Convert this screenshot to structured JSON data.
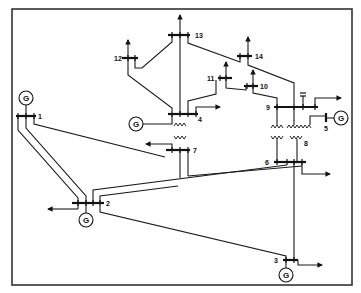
{
  "diagram": {
    "frame": {
      "x": 12,
      "y": 9,
      "width": 340,
      "height": 276
    },
    "colors": {
      "line": "#1a1a1a",
      "background": "#ffffff"
    },
    "generator_symbol": "G",
    "buses": [
      {
        "id": "1",
        "label": "1"
      },
      {
        "id": "2",
        "label": "2"
      },
      {
        "id": "3",
        "label": "3"
      },
      {
        "id": "4",
        "label": "4"
      },
      {
        "id": "5",
        "label": "5"
      },
      {
        "id": "6",
        "label": "6"
      },
      {
        "id": "7",
        "label": "7"
      },
      {
        "id": "8",
        "label": "8"
      },
      {
        "id": "9",
        "label": "9"
      },
      {
        "id": "10",
        "label": "10"
      },
      {
        "id": "11",
        "label": "11"
      },
      {
        "id": "12",
        "label": "12"
      },
      {
        "id": "13",
        "label": "13"
      },
      {
        "id": "14",
        "label": "14"
      }
    ],
    "generators": [
      {
        "bus": "1",
        "label": "G"
      },
      {
        "bus": "2",
        "label": "G"
      },
      {
        "bus": "3",
        "label": "G"
      },
      {
        "bus": "4",
        "label": "G"
      },
      {
        "bus": "5",
        "label": "G"
      }
    ],
    "transformers": [
      {
        "from": "4",
        "to": "7"
      },
      {
        "from": "9",
        "to": "6"
      },
      {
        "from": "9",
        "to": "8"
      }
    ],
    "loads": [
      "2",
      "3",
      "4",
      "6",
      "7",
      "9",
      "10",
      "11",
      "12",
      "13",
      "14"
    ],
    "lines": [
      {
        "from": "1",
        "to": "2"
      },
      {
        "from": "1",
        "to": "7"
      },
      {
        "from": "2",
        "to": "3"
      },
      {
        "from": "2",
        "to": "6"
      },
      {
        "from": "2",
        "to": "7"
      },
      {
        "from": "3",
        "to": "6"
      },
      {
        "from": "4",
        "to": "11"
      },
      {
        "from": "4",
        "to": "12"
      },
      {
        "from": "4",
        "to": "13"
      },
      {
        "from": "11",
        "to": "10"
      },
      {
        "from": "10",
        "to": "9"
      },
      {
        "from": "13",
        "to": "14"
      },
      {
        "from": "14",
        "to": "9"
      },
      {
        "from": "12",
        "to": "13"
      },
      {
        "from": "8",
        "to": "5"
      }
    ]
  }
}
